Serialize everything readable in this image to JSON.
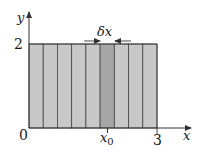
{
  "figure": {
    "axes": {
      "x_label": "x",
      "y_label": "y",
      "origin_label": "0",
      "x_tick_label": "3",
      "y_tick_label": "2",
      "x0_label": "x",
      "x0_subscript": "0"
    },
    "strip_label": "δx",
    "strip_count": 9,
    "highlighted_strip_index": 5,
    "colors": {
      "fill": "#c8c8c8",
      "highlight_fill": "#a6a6a6",
      "stroke": "#444444",
      "axis": "#333333"
    }
  }
}
